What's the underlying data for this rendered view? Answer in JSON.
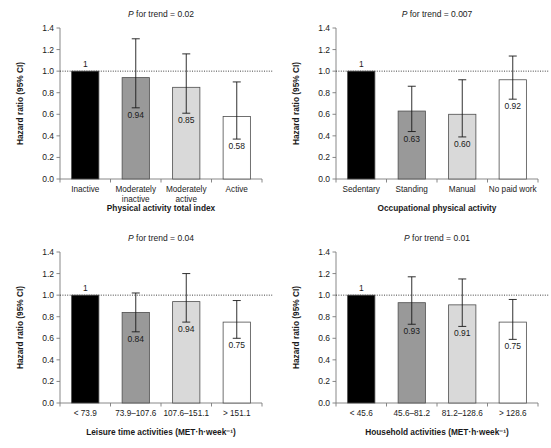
{
  "figure": {
    "axis_y_title": "Hazard ratio (95% CI)",
    "y_ticks": [
      "0.0",
      "0.2",
      "0.4",
      "0.6",
      "0.8",
      "1.0",
      "1.2",
      "1.4"
    ],
    "colors": {
      "reference_bar": "#000000",
      "bar_2": "#999999",
      "bar_3": "#d9d9d9",
      "bar_4": "#ffffff",
      "axis": "#7a7a7a",
      "text": "#1a1a1a",
      "reference_line": "#2b2b2b"
    }
  },
  "chart_data": [
    {
      "type": "bar",
      "panel": "top-left",
      "title": "P for trend = 0.02",
      "p_for_trend": "0.02",
      "xlabel": "Physical activity total index",
      "ylabel": "Hazard ratio (95% CI)",
      "ylim": [
        0.0,
        1.4
      ],
      "yticks": [
        0.0,
        0.2,
        0.4,
        0.6,
        0.8,
        1.0,
        1.2,
        1.4
      ],
      "reference_line": 1.0,
      "grid": false,
      "legend": "none",
      "categories": [
        "Inactive",
        "Moderately inactive",
        "Moderately active",
        "Active"
      ],
      "category_lines": [
        [
          "Inactive"
        ],
        [
          "Moderately",
          "inactive"
        ],
        [
          "Moderately",
          "active"
        ],
        [
          "Active"
        ]
      ],
      "values": [
        1.0,
        0.94,
        0.85,
        0.58
      ],
      "value_labels": [
        "1",
        "0.94",
        "0.85",
        "0.58"
      ],
      "ci_low": [
        null,
        0.66,
        0.61,
        0.37
      ],
      "ci_high": [
        null,
        1.3,
        1.16,
        0.9
      ],
      "bar_colors": [
        "#000000",
        "#999999",
        "#d9d9d9",
        "#ffffff"
      ]
    },
    {
      "type": "bar",
      "panel": "top-right",
      "title": "P for trend = 0.007",
      "p_for_trend": "0.007",
      "xlabel": "Occupational physical activity",
      "ylabel": "Hazard ratio (95% CI)",
      "ylim": [
        0.0,
        1.4
      ],
      "yticks": [
        0.0,
        0.2,
        0.4,
        0.6,
        0.8,
        1.0,
        1.2,
        1.4
      ],
      "reference_line": 1.0,
      "grid": false,
      "legend": "none",
      "categories": [
        "Sedentary",
        "Standing",
        "Manual",
        "No paid work"
      ],
      "category_lines": [
        [
          "Sedentary"
        ],
        [
          "Standing"
        ],
        [
          "Manual"
        ],
        [
          "No paid work"
        ]
      ],
      "values": [
        1.0,
        0.63,
        0.6,
        0.92
      ],
      "value_labels": [
        "1",
        "0.63",
        "0.60",
        "0.92"
      ],
      "ci_low": [
        null,
        0.44,
        0.39,
        0.74
      ],
      "ci_high": [
        null,
        0.86,
        0.92,
        1.14
      ],
      "bar_colors": [
        "#000000",
        "#999999",
        "#d9d9d9",
        "#ffffff"
      ]
    },
    {
      "type": "bar",
      "panel": "bottom-left",
      "title": "P for trend = 0.04",
      "p_for_trend": "0.04",
      "xlabel": "Leisure time activities (MET·h·week⁻¹)",
      "ylabel": "Hazard ratio (95% CI)",
      "ylim": [
        0.0,
        1.4
      ],
      "yticks": [
        0.0,
        0.2,
        0.4,
        0.6,
        0.8,
        1.0,
        1.2,
        1.4
      ],
      "reference_line": 1.0,
      "grid": false,
      "legend": "none",
      "categories": [
        "< 73.9",
        "73.9–107.6",
        "107.6–151.1",
        "> 151.1"
      ],
      "category_lines": [
        [
          "< 73.9"
        ],
        [
          "73.9–107.6"
        ],
        [
          "107.6–151.1"
        ],
        [
          "> 151.1"
        ]
      ],
      "values": [
        1.0,
        0.84,
        0.94,
        0.75
      ],
      "value_labels": [
        "1",
        "0.84",
        "0.94",
        "0.75"
      ],
      "ci_low": [
        null,
        0.66,
        0.75,
        0.6
      ],
      "ci_high": [
        null,
        1.02,
        1.2,
        0.95
      ],
      "bar_colors": [
        "#000000",
        "#999999",
        "#d9d9d9",
        "#ffffff"
      ]
    },
    {
      "type": "bar",
      "panel": "bottom-right",
      "title": "P for trend = 0.01",
      "p_for_trend": "0.01",
      "xlabel": "Household activities (MET·h·week⁻¹)",
      "ylabel": "Hazard ratio (95% CI)",
      "ylim": [
        0.0,
        1.4
      ],
      "yticks": [
        0.0,
        0.2,
        0.4,
        0.6,
        0.8,
        1.0,
        1.2,
        1.4
      ],
      "reference_line": 1.0,
      "grid": false,
      "legend": "none",
      "categories": [
        "< 45.6",
        "45.6–81.2",
        "81.2–128.6",
        "> 128.6"
      ],
      "category_lines": [
        [
          "< 45.6"
        ],
        [
          "45.6–81.2"
        ],
        [
          "81.2–128.6"
        ],
        [
          "> 128.6"
        ]
      ],
      "values": [
        1.0,
        0.93,
        0.91,
        0.75
      ],
      "value_labels": [
        "1",
        "0.93",
        "0.91",
        "0.75"
      ],
      "ci_low": [
        null,
        0.73,
        0.71,
        0.59
      ],
      "ci_high": [
        null,
        1.17,
        1.15,
        0.96
      ],
      "bar_colors": [
        "#000000",
        "#999999",
        "#d9d9d9",
        "#ffffff"
      ]
    }
  ]
}
